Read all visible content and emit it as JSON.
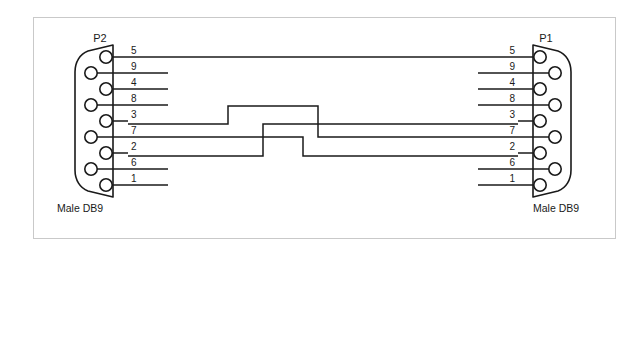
{
  "diagram": {
    "type": "cable-wiring-schematic",
    "background_color": "#ffffff",
    "line_color": "#1a1a1a",
    "frame_color": "#c9c9c9"
  },
  "connectors": {
    "left": {
      "id": "P2",
      "label": "P2",
      "caption": "Male DB9",
      "gender": "male",
      "shell": "DB9",
      "pin_rows": [
        "5",
        "9",
        "4",
        "8",
        "3",
        "7",
        "2",
        "6",
        "1"
      ]
    },
    "right": {
      "id": "P1",
      "label": "P1",
      "caption": "Male DB9",
      "gender": "male",
      "shell": "DB9",
      "pin_rows": [
        "5",
        "9",
        "4",
        "8",
        "3",
        "7",
        "2",
        "6",
        "1"
      ]
    }
  },
  "pin_rows": [
    {
      "index": 0,
      "label": "5",
      "y": 57,
      "column": "right"
    },
    {
      "index": 1,
      "label": "9",
      "y": 73,
      "column": "left"
    },
    {
      "index": 2,
      "label": "4",
      "y": 89,
      "column": "right"
    },
    {
      "index": 3,
      "label": "8",
      "y": 105,
      "column": "left"
    },
    {
      "index": 4,
      "label": "3",
      "y": 121,
      "column": "right"
    },
    {
      "index": 5,
      "label": "7",
      "y": 137,
      "column": "left"
    },
    {
      "index": 6,
      "label": "2",
      "y": 153,
      "column": "right"
    },
    {
      "index": 7,
      "label": "6",
      "y": 169,
      "column": "left"
    },
    {
      "index": 8,
      "label": "1",
      "y": 185,
      "column": "right"
    }
  ],
  "connections": [
    {
      "name": "pin5-to-pin5",
      "from": "P2.5",
      "to": "P1.5",
      "routing": "straight"
    },
    {
      "name": "pin3-to-pin7",
      "from": "P2.3",
      "to": "P1.7",
      "routing": "crossover-over"
    },
    {
      "name": "pin2-to-pin3",
      "from": "P2.2",
      "to": "P1.3",
      "routing": "crossover-up"
    },
    {
      "name": "pin7-to-pin2",
      "from": "P2.7",
      "to": "P1.2",
      "routing": "crossover-down"
    }
  ],
  "unconnected_stubs": {
    "left": [
      "9",
      "4",
      "8",
      "6",
      "1"
    ],
    "right": [
      "9",
      "4",
      "8",
      "6",
      "1"
    ]
  }
}
